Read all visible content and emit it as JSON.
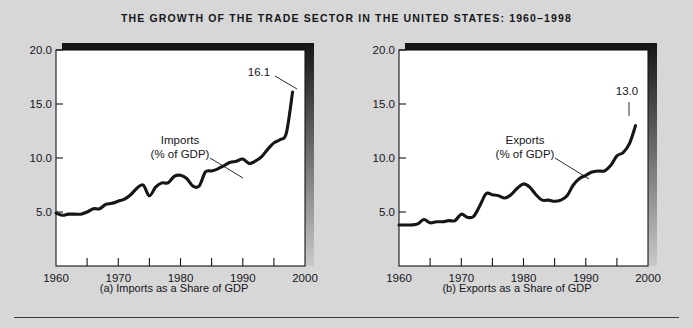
{
  "figure": {
    "title": "THE GROWTH OF THE TRADE SECTOR IN THE UNITED STATES: 1960–1998",
    "background_color": "#d7d7d7",
    "plot_background_color": "#ffffff",
    "ink_color": "#15151a"
  },
  "panels": {
    "a": {
      "caption": "(a) Imports as a Share of GDP",
      "series_label_line1": "Imports",
      "series_label_line2": "(% of GDP)",
      "endpoint_label": "16.1"
    },
    "b": {
      "caption": "(b) Exports as a Share of GDP",
      "series_label_line1": "Exports",
      "series_label_line2": "(% of GDP)",
      "endpoint_label": "13.0"
    }
  },
  "chart_data": [
    {
      "type": "line",
      "id": "imports",
      "title": "(a) Imports as a Share of GDP",
      "xlabel": "",
      "ylabel": "",
      "xlim": [
        1960,
        2000
      ],
      "ylim": [
        0,
        20
      ],
      "yticks": [
        5.0,
        10.0,
        15.0,
        20.0
      ],
      "ytick_labels": [
        "5.0",
        "10.0",
        "15.0",
        "20.0"
      ],
      "xticks": [
        1960,
        1965,
        1970,
        1975,
        1980,
        1985,
        1990,
        1995,
        2000
      ],
      "xtick_labels": [
        "1960",
        "",
        "1970",
        "",
        "1980",
        "",
        "1990",
        "",
        "2000"
      ],
      "grid": false,
      "legend": "annotation",
      "annotations": [
        {
          "text": "Imports\n(% of GDP)",
          "x": 1976,
          "y": 12.6
        },
        {
          "text": "16.1",
          "x": 1993.5,
          "y": 17.6
        }
      ],
      "series": [
        {
          "name": "Imports (% of GDP)",
          "x": [
            1960,
            1961,
            1962,
            1963,
            1964,
            1965,
            1966,
            1967,
            1968,
            1969,
            1970,
            1971,
            1972,
            1973,
            1974,
            1975,
            1976,
            1977,
            1978,
            1979,
            1980,
            1981,
            1982,
            1983,
            1984,
            1985,
            1986,
            1987,
            1988,
            1989,
            1990,
            1991,
            1992,
            1993,
            1994,
            1995,
            1996,
            1997,
            1998
          ],
          "values": [
            4.9,
            4.7,
            4.8,
            4.8,
            4.8,
            5.0,
            5.3,
            5.3,
            5.7,
            5.8,
            6.0,
            6.2,
            6.6,
            7.2,
            7.5,
            6.5,
            7.3,
            7.7,
            7.7,
            8.3,
            8.4,
            8.1,
            7.4,
            7.4,
            8.7,
            8.8,
            9.0,
            9.3,
            9.6,
            9.7,
            9.9,
            9.5,
            9.7,
            10.1,
            10.8,
            11.4,
            11.7,
            12.3,
            16.1
          ]
        }
      ]
    },
    {
      "type": "line",
      "id": "exports",
      "title": "(b) Exports as a Share of GDP",
      "xlabel": "",
      "ylabel": "",
      "xlim": [
        1960,
        2000
      ],
      "ylim": [
        0,
        20
      ],
      "yticks": [
        5.0,
        10.0,
        15.0,
        20.0
      ],
      "ytick_labels": [
        "5.0",
        "10.0",
        "15.0",
        "20.0"
      ],
      "xticks": [
        1960,
        1965,
        1970,
        1975,
        1980,
        1985,
        1990,
        1995,
        2000
      ],
      "xtick_labels": [
        "1960",
        "",
        "1970",
        "",
        "1980",
        "",
        "1990",
        "",
        "2000"
      ],
      "grid": false,
      "legend": "annotation",
      "annotations": [
        {
          "text": "Exports\n(% of GDP)",
          "x": 1976.5,
          "y": 12.6
        },
        {
          "text": "13.0",
          "x": 1994.5,
          "y": 14.9
        }
      ],
      "series": [
        {
          "name": "Exports (% of GDP)",
          "x": [
            1960,
            1961,
            1962,
            1963,
            1964,
            1965,
            1966,
            1967,
            1968,
            1969,
            1970,
            1971,
            1972,
            1973,
            1974,
            1975,
            1976,
            1977,
            1978,
            1979,
            1980,
            1981,
            1982,
            1983,
            1984,
            1985,
            1986,
            1987,
            1988,
            1989,
            1990,
            1991,
            1992,
            1993,
            1994,
            1995,
            1996,
            1997,
            1998
          ],
          "values": [
            3.8,
            3.8,
            3.8,
            3.9,
            4.3,
            4.0,
            4.1,
            4.1,
            4.2,
            4.2,
            4.8,
            4.5,
            4.6,
            5.6,
            6.7,
            6.6,
            6.5,
            6.3,
            6.6,
            7.2,
            7.6,
            7.3,
            6.6,
            6.1,
            6.1,
            6.0,
            6.1,
            6.5,
            7.5,
            8.1,
            8.4,
            8.7,
            8.8,
            8.8,
            9.3,
            10.2,
            10.5,
            11.3,
            13.0
          ]
        }
      ]
    }
  ]
}
